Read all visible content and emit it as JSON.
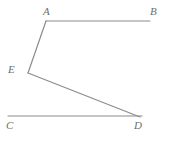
{
  "figure": {
    "kind": "geometry-diagram",
    "background_color": "#ffffff",
    "stroke_color": "#8c8c8c",
    "label_color": "#6e6e6e",
    "stroke_width": 1.2,
    "canvas": {
      "width": 169,
      "height": 146
    },
    "points": {
      "A": {
        "label": "A",
        "x": 46,
        "y": 21,
        "label_x": 43,
        "label_y": 6
      },
      "B": {
        "label": "B",
        "x": 150,
        "y": 21,
        "label_x": 150,
        "label_y": 6
      },
      "C": {
        "label": "C",
        "x": 8,
        "y": 116,
        "label_x": 6,
        "label_y": 120
      },
      "D": {
        "label": "D",
        "x": 140,
        "y": 117,
        "label_x": 134,
        "label_y": 120
      },
      "E": {
        "label": "E",
        "x": 28,
        "y": 73,
        "label_x": 8,
        "label_y": 64
      }
    },
    "segments": [
      {
        "name": "segment-AB",
        "from": "A",
        "to": "B",
        "x1": 46,
        "y1": 21,
        "x2": 150,
        "y2": 21
      },
      {
        "name": "segment-AE",
        "from": "A",
        "to": "E",
        "x1": 46,
        "y1": 21,
        "x2": 28,
        "y2": 73
      },
      {
        "name": "segment-ED",
        "from": "E",
        "to": "D",
        "x1": 28,
        "y1": 73,
        "x2": 140,
        "y2": 117
      },
      {
        "name": "segment-CD",
        "from": "C",
        "to": "D",
        "x1": 8,
        "y1": 116,
        "x2": 142,
        "y2": 116
      }
    ]
  }
}
